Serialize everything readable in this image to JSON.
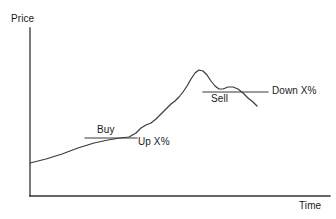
{
  "figure": {
    "title": "",
    "background_color": "#ffffff",
    "stroke_color": "#333333",
    "text_color": "#1a1a1a"
  },
  "axes": {
    "y_label": "Price",
    "x_label": "Time",
    "origin": {
      "x": 30,
      "y": 196
    },
    "y_axis_top": {
      "x": 30,
      "y": 28
    },
    "x_axis_right": {
      "x": 330,
      "y": 196
    }
  },
  "annotations": [
    {
      "id": "buy",
      "label": "Buy",
      "line": {
        "x1": 85,
        "y1": 138,
        "x2": 137,
        "y2": 138
      },
      "label_position": "above-left"
    },
    {
      "id": "up-percent",
      "label": "Up X%",
      "line": null,
      "label_position": "right-of-buy-line"
    },
    {
      "id": "sell",
      "label": "Sell",
      "line": {
        "x1": 203,
        "y1": 92,
        "x2": 268,
        "y2": 92
      },
      "label_position": "below-left"
    },
    {
      "id": "down-percent",
      "label": "Down X%",
      "line": null,
      "label_position": "right-of-sell-line"
    }
  ],
  "chart_data": {
    "type": "line",
    "title": "",
    "xlabel": "Time",
    "ylabel": "Price",
    "grid": false,
    "legend": null,
    "axis_ticks": {
      "x": [],
      "y": []
    },
    "xlim": [
      30,
      330
    ],
    "ylim": [
      196,
      28
    ],
    "note": "Stylised stock price curve: slow rise, breakout above the Buy line (Up X%), steep climb to a peak, pullback with a lower rebound, then breakdown through the Sell line (Down X%). Coordinates are in screenshot pixel space, y grows downward.",
    "series": [
      {
        "name": "price",
        "points": [
          [
            30,
            163
          ],
          [
            46,
            159
          ],
          [
            62,
            154
          ],
          [
            78,
            148
          ],
          [
            94,
            143
          ],
          [
            108,
            140
          ],
          [
            120,
            138
          ],
          [
            129,
            137
          ],
          [
            136,
            133
          ],
          [
            141,
            128
          ],
          [
            146,
            125
          ],
          [
            151,
            123
          ],
          [
            156,
            119
          ],
          [
            161,
            114
          ],
          [
            166,
            109
          ],
          [
            171,
            104
          ],
          [
            175,
            101
          ],
          [
            179,
            97
          ],
          [
            183,
            92
          ],
          [
            187,
            86
          ],
          [
            191,
            79
          ],
          [
            195,
            73
          ],
          [
            199,
            70
          ],
          [
            203,
            71
          ],
          [
            207,
            75
          ],
          [
            211,
            81
          ],
          [
            215,
            86
          ],
          [
            219,
            89
          ],
          [
            223,
            89
          ],
          [
            228,
            87
          ],
          [
            233,
            87
          ],
          [
            238,
            89
          ],
          [
            243,
            93
          ],
          [
            248,
            98
          ],
          [
            253,
            102
          ],
          [
            257,
            106
          ]
        ]
      }
    ]
  }
}
